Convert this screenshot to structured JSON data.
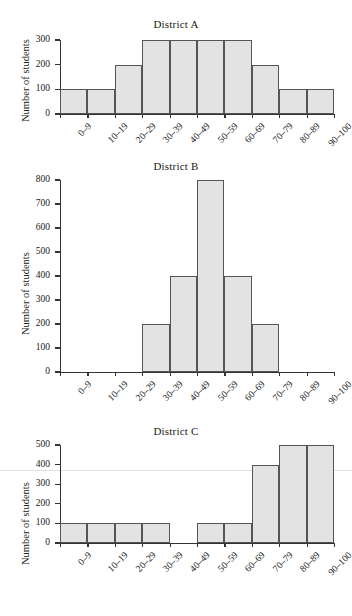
{
  "page": {
    "background_color": "#ffffff",
    "bar_fill_color": "#e3e3e3",
    "bar_stroke_color": "#555555",
    "axis_color": "#333333"
  },
  "chart_data": [
    {
      "type": "bar",
      "title": "District A",
      "xlabel": "",
      "ylabel": "Number of students",
      "categories": [
        "0–9",
        "10–19",
        "20–29",
        "30–39",
        "40–49",
        "50–59",
        "60–69",
        "70–79",
        "80–89",
        "90–100"
      ],
      "values": [
        100,
        100,
        200,
        300,
        300,
        300,
        300,
        200,
        100,
        100
      ],
      "yticks": [
        0,
        100,
        200,
        300
      ],
      "ytick_labels": [
        "0",
        "100",
        "200",
        "300"
      ],
      "ylim": [
        0,
        300
      ],
      "grid": false,
      "legend": "none"
    },
    {
      "type": "bar",
      "title": "District B",
      "xlabel": "",
      "ylabel": "Number of students",
      "categories": [
        "0–9",
        "10–19",
        "20–29",
        "30–39",
        "40–49",
        "50–59",
        "60–69",
        "70–79",
        "80–89",
        "90–100"
      ],
      "values": [
        0,
        0,
        0,
        200,
        400,
        800,
        400,
        200,
        0,
        0
      ],
      "yticks": [
        0,
        100,
        200,
        300,
        400,
        500,
        600,
        700,
        800
      ],
      "ytick_labels": [
        "0",
        "100",
        "200",
        "300",
        "400",
        "500",
        "600",
        "700",
        "800"
      ],
      "ylim": [
        0,
        800
      ],
      "grid": false,
      "legend": "none"
    },
    {
      "type": "bar",
      "title": "District C",
      "xlabel": "",
      "ylabel": "Number of students",
      "categories": [
        "0–9",
        "10–19",
        "20–29",
        "30–39",
        "40–49",
        "50–59",
        "60–69",
        "70–79",
        "80–89",
        "90–100"
      ],
      "values": [
        100,
        100,
        100,
        100,
        0,
        100,
        100,
        400,
        500,
        500
      ],
      "yticks": [
        0,
        100,
        200,
        300,
        400,
        500
      ],
      "ytick_labels": [
        "0",
        "100",
        "200",
        "300",
        "400",
        "500"
      ],
      "ylim": [
        0,
        500
      ],
      "grid": false,
      "legend": "none"
    }
  ]
}
